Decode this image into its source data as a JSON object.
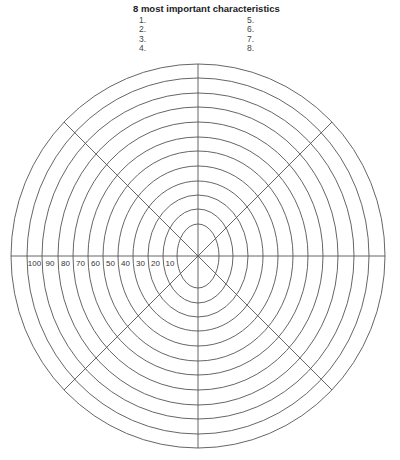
{
  "header": {
    "title": "8 most important characteristics",
    "left_items": [
      "1.",
      "2.",
      "3.",
      "4."
    ],
    "right_items": [
      "5.",
      "6.",
      "7.",
      "8."
    ]
  },
  "wheel": {
    "spokes": 8,
    "scale_labels": [
      "100",
      "90",
      "80",
      "70",
      "60",
      "50",
      "40",
      "30",
      "20",
      "10"
    ],
    "scale_values": [
      100,
      90,
      80,
      70,
      60,
      50,
      40,
      30,
      20,
      10
    ],
    "line_color": "#555555"
  }
}
